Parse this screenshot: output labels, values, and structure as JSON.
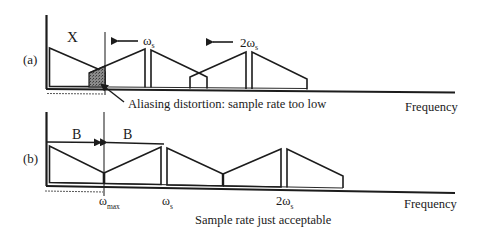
{
  "panel_a": {
    "tag": "(a)",
    "signal_label": "X",
    "ws_label": "ω",
    "ws_sub": "s",
    "two_ws_label": "2ω",
    "two_ws_sub": "s",
    "annotation": "Aliasing distortion: sample rate too low",
    "axis_label": "Frequency"
  },
  "panel_b": {
    "tag": "(b)",
    "bandwidth_left": "B",
    "bandwidth_right": "B",
    "wmax_label": "ω",
    "wmax_sub": "max",
    "ws_label": "ω",
    "ws_sub": "s",
    "two_ws_label": "2ω",
    "two_ws_sub": "s",
    "axis_label": "Frequency",
    "caption": "Sample rate just acceptable"
  },
  "colors": {
    "ink": "#1c1c1c",
    "alias_fill": "#7a7a7a"
  }
}
